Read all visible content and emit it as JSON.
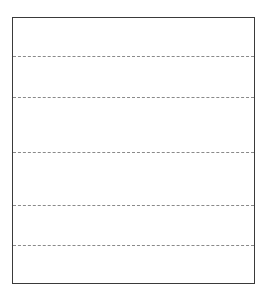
{
  "page": {
    "kind": "blank ruled writing box",
    "rule_style": "dashed",
    "rule_count": 5,
    "rules": [
      {
        "label": ""
      },
      {
        "label": ""
      },
      {
        "label": ""
      },
      {
        "label": ""
      },
      {
        "label": ""
      }
    ],
    "colors": {
      "border": "#3a3a3a",
      "rule": "#8a8a8a",
      "background": "#ffffff"
    }
  }
}
